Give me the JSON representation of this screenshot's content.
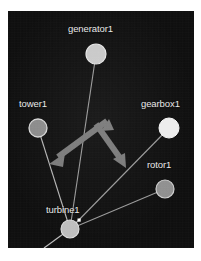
{
  "figure": {
    "type": "node-link-graph",
    "background_color": "#0d0d0d",
    "page_color": "#ffffff",
    "label_color": "#e8e8e8"
  },
  "nodes": [
    {
      "id": "generator1",
      "label": "generator1",
      "x": 88,
      "y": 43,
      "r": 10,
      "fill": "#c9c9c9",
      "stroke": "#e6e6e6",
      "label_x": 60,
      "label_y": 17
    },
    {
      "id": "tower1",
      "label": "tower1",
      "x": 30,
      "y": 117,
      "r": 9,
      "fill": "#8a8a8a",
      "stroke": "#d6d6d6",
      "label_x": 12,
      "label_y": 92
    },
    {
      "id": "gearbox1",
      "label": "gearbox1",
      "x": 161,
      "y": 117,
      "r": 10,
      "fill": "#ededed",
      "stroke": "#f7f7f7",
      "label_x": 134,
      "label_y": 92
    },
    {
      "id": "rotor1",
      "label": "rotor1",
      "x": 157,
      "y": 178,
      "r": 9,
      "fill": "#8f8f8f",
      "stroke": "#cfcfcf",
      "label_x": 140,
      "label_y": 153
    },
    {
      "id": "turbine1",
      "label": "turbine1",
      "x": 62,
      "y": 218,
      "r": 9,
      "fill": "#bdbdbd",
      "stroke": "#dedede",
      "label_x": 39,
      "label_y": 198
    }
  ],
  "edges": [
    {
      "from": "turbine1",
      "to": "generator1",
      "color": "#9a9a9a",
      "width": 1.1
    },
    {
      "from": "turbine1",
      "to": "tower1",
      "color": "#b5b5b5",
      "width": 1.1
    },
    {
      "from": "turbine1",
      "to": "gearbox1",
      "color": "#9a9a9a",
      "width": 1.1
    },
    {
      "from": "turbine1",
      "to": "rotor1",
      "color": "#9a9a9a",
      "width": 1.1
    }
  ],
  "stub_edges": [
    {
      "name": "turbine1-lower-left-stub",
      "x1": 62,
      "y1": 218,
      "x2": 36,
      "y2": 237,
      "color": "#bcbcbc",
      "width": 1.2
    }
  ],
  "markers": [
    {
      "name": "turbine1-selection-marker",
      "x": 71,
      "y": 209,
      "size": 3,
      "fill": "#ffffff"
    }
  ],
  "arrows": [
    {
      "name": "arrow-down-left",
      "from_x": 100,
      "from_y": 110,
      "to_x": 43,
      "to_y": 152,
      "color": "#777777",
      "width": 6
    },
    {
      "name": "arrow-down-right",
      "from_x": 88,
      "from_y": 113,
      "to_x": 117,
      "to_y": 155,
      "color": "#777777",
      "width": 6
    }
  ]
}
